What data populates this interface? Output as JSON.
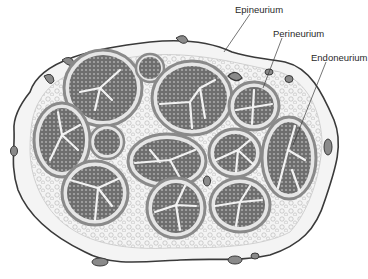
{
  "diagram": {
    "labels": [
      {
        "id": "epineurium",
        "text": "Epineurium",
        "x": 235,
        "y": 4
      },
      {
        "id": "perineurium",
        "text": "Perineurium",
        "x": 273,
        "y": 28
      },
      {
        "id": "endoneurium",
        "text": "Endoneurium",
        "x": 311,
        "y": 52
      }
    ],
    "colors": {
      "outline": "#3a3a3a",
      "epineurium_fill": "#f4f4f4",
      "perineurium_ring": "#9a9a9a",
      "fascicle_fill": "#7c7c7c",
      "endoneurium_septa": "#f2f2f2",
      "vessel_fill": "#8a8a8a"
    }
  }
}
